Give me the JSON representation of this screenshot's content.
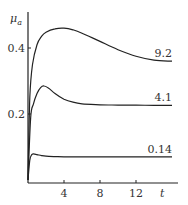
{
  "chart_data": {
    "type": "line",
    "title": "",
    "xlabel": "t",
    "ylabel": "μa",
    "ylabel_main": "μ",
    "ylabel_sub": "a",
    "xlim": [
      0,
      16
    ],
    "ylim": [
      0,
      0.5
    ],
    "x_ticks": [
      4,
      8,
      12
    ],
    "x_tick_labels": [
      "4",
      "8",
      "12"
    ],
    "y_ticks": [
      0.2,
      0.4
    ],
    "y_tick_labels": [
      "0.2",
      "0.4"
    ],
    "grid": false,
    "legend": "inline labels at right end of each curve",
    "series": [
      {
        "name": "9.2",
        "label": "9.2",
        "x": [
          0,
          0.2,
          0.5,
          1,
          1.5,
          2,
          3,
          4,
          5,
          6,
          8,
          10,
          12,
          14,
          16
        ],
        "y": [
          0,
          0.25,
          0.35,
          0.41,
          0.435,
          0.448,
          0.458,
          0.46,
          0.455,
          0.445,
          0.42,
          0.395,
          0.375,
          0.363,
          0.36
        ]
      },
      {
        "name": "4.1",
        "label": "4.1",
        "x": [
          0,
          0.3,
          0.6,
          1,
          1.4,
          1.8,
          2.3,
          3,
          4,
          5,
          6,
          8,
          10,
          12,
          14,
          16
        ],
        "y": [
          0,
          0.19,
          0.23,
          0.262,
          0.28,
          0.285,
          0.278,
          0.262,
          0.245,
          0.236,
          0.231,
          0.228,
          0.227,
          0.227,
          0.226,
          0.226
        ]
      },
      {
        "name": "0.14",
        "label": "0.14",
        "x": [
          0,
          0.2,
          0.4,
          0.6,
          1,
          1.5,
          2,
          3,
          4,
          6,
          8,
          10,
          12,
          14,
          16
        ],
        "y": [
          0,
          0.06,
          0.076,
          0.079,
          0.077,
          0.074,
          0.072,
          0.071,
          0.07,
          0.07,
          0.07,
          0.07,
          0.07,
          0.07,
          0.07
        ]
      }
    ]
  }
}
